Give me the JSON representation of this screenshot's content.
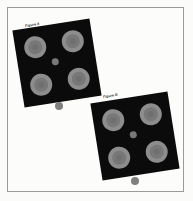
{
  "page": {
    "width": 193,
    "height": 201,
    "background_color": "#fbfbfa",
    "frame_color": "#9a9a9a"
  },
  "colors": {
    "panel_fill": "#0b0b0b",
    "spot_outer": "#8d8d8d",
    "spot_ring": "#787878",
    "spot_core": "#6f6f6f",
    "center_dot": "#787878",
    "marker_dot": "#7f7f7f"
  },
  "panels": [
    {
      "id": "panel-a",
      "label": "Figure A",
      "rotation_deg": -9,
      "spots": [
        {
          "position": "top-left",
          "x": 9,
          "y": 9,
          "d": 22
        },
        {
          "position": "top-right",
          "x": 47,
          "y": 9,
          "d": 22
        },
        {
          "position": "bottom-left",
          "x": 9,
          "y": 47,
          "d": 22
        },
        {
          "position": "bottom-right",
          "x": 47,
          "y": 47,
          "d": 22
        }
      ],
      "center_dot": {
        "x": 34,
        "y": 34,
        "d": 7
      },
      "marker_dot": {
        "x": 55,
        "y": 102,
        "d": 8
      }
    },
    {
      "id": "panel-b",
      "label": "Figure B",
      "rotation_deg": -9,
      "spots": [
        {
          "position": "top-left",
          "x": 9,
          "y": 9,
          "d": 22
        },
        {
          "position": "top-right",
          "x": 47,
          "y": 9,
          "d": 22
        },
        {
          "position": "bottom-left",
          "x": 9,
          "y": 47,
          "d": 22
        },
        {
          "position": "bottom-right",
          "x": 47,
          "y": 47,
          "d": 22
        }
      ],
      "center_dot": {
        "x": 34,
        "y": 34,
        "d": 7
      },
      "marker_dot": {
        "x": 131,
        "y": 177,
        "d": 8
      }
    }
  ]
}
